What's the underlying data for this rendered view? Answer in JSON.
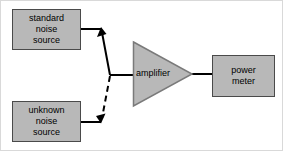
{
  "diagram": {
    "background_color": "#ffffff",
    "block_fill_color": "#b8b8b8",
    "block_stroke_color": "#4a4a4a",
    "wire_color": "#000000",
    "blocks": {
      "standard_source": {
        "line1": "standard",
        "line2": "noise",
        "line3": "source"
      },
      "unknown_source": {
        "line1": "unknown",
        "line2": "noise",
        "line3": "source"
      },
      "amplifier": {
        "label": "amplifier"
      },
      "power_meter": {
        "line1": "power",
        "line2": "meter"
      }
    },
    "connections": [
      {
        "name": "standard-to-switch",
        "style": "solid",
        "from": "standard_source",
        "to": "switch-node",
        "arrow": true
      },
      {
        "name": "unknown-to-switch",
        "style": "dashed",
        "from": "unknown_source",
        "to": "switch-node",
        "arrow": true
      },
      {
        "name": "switch-to-amplifier",
        "style": "solid",
        "from": "switch-node",
        "to": "amplifier",
        "arrow": false
      },
      {
        "name": "amplifier-to-power-meter",
        "style": "solid",
        "from": "amplifier",
        "to": "power_meter",
        "arrow": false
      }
    ]
  }
}
